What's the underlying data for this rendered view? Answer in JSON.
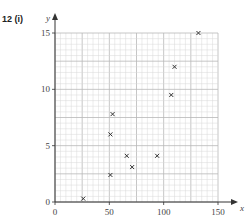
{
  "question_label": "12  (i)",
  "chart_data": {
    "type": "scatter",
    "title": "",
    "xlabel": "x",
    "ylabel": "y",
    "xlim": [
      0,
      150
    ],
    "ylim": [
      0,
      15
    ],
    "xticks": [
      0,
      50,
      100,
      150
    ],
    "yticks": [
      0,
      5,
      10,
      15
    ],
    "grid": true,
    "grid_minor_x": 5,
    "grid_minor_y": 0.5,
    "marker": "x",
    "points": [
      {
        "x": 26,
        "y": 0.3
      },
      {
        "x": 51,
        "y": 2.4
      },
      {
        "x": 51,
        "y": 6.0
      },
      {
        "x": 53,
        "y": 7.8
      },
      {
        "x": 66,
        "y": 4.1
      },
      {
        "x": 71,
        "y": 3.1
      },
      {
        "x": 94,
        "y": 4.1
      },
      {
        "x": 107,
        "y": 9.5
      },
      {
        "x": 110,
        "y": 12.0
      },
      {
        "x": 132,
        "y": 15.0
      }
    ]
  },
  "colors": {
    "grid_minor": "#d8d8d8",
    "grid_major": "#b8b8b8",
    "axis": "#333333",
    "marker": "#333333"
  }
}
